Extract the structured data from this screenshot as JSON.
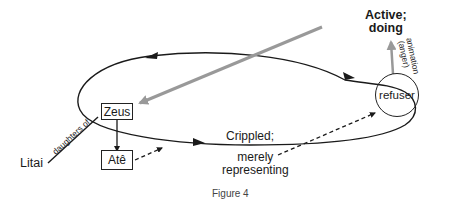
{
  "figure": {
    "caption": "Figure 4",
    "nodes": {
      "zeus": "Zeus",
      "ate": "Atê",
      "refuser": "refuser",
      "litai": "Litai"
    },
    "labels": {
      "active_line1": "Active;",
      "active_line2": "doing",
      "crippled": "Crippled;",
      "merely": "merely",
      "representing": "representing",
      "daughters_of": "daughters of",
      "animation": "animation",
      "anger": "(anger)"
    },
    "colors": {
      "line": "#1a1a1a",
      "gray_arrow": "#999999"
    }
  }
}
